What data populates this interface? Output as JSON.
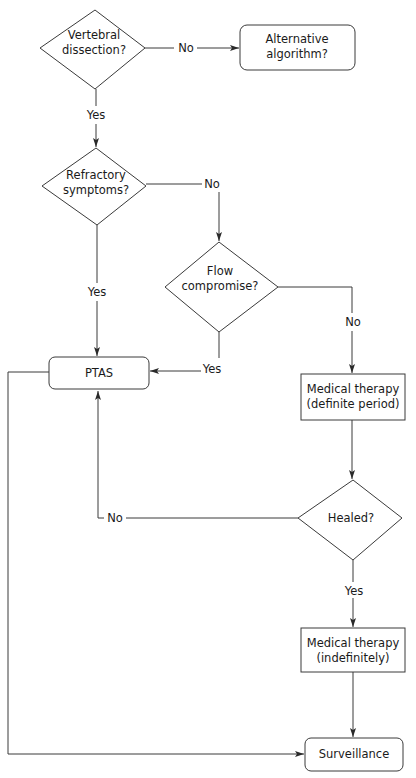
{
  "diagram": {
    "type": "flowchart",
    "nodes": {
      "vertebral_dissection": {
        "shape": "diamond",
        "line1": "Vertebral",
        "line2": "dissection?"
      },
      "alternative_algorithm": {
        "shape": "rounded-rect",
        "line1": "Alternative",
        "line2": "algorithm?"
      },
      "refractory_symptoms": {
        "shape": "diamond",
        "line1": "Refractory",
        "line2": "symptoms?"
      },
      "flow_compromise": {
        "shape": "diamond",
        "line1": "Flow",
        "line2": "compromise?"
      },
      "ptas": {
        "shape": "rounded-rect",
        "label": "PTAS"
      },
      "medical_therapy_definite": {
        "shape": "rect",
        "line1": "Medical therapy",
        "line2": "(definite period)"
      },
      "healed": {
        "shape": "diamond",
        "label": "Healed?"
      },
      "medical_therapy_indefinite": {
        "shape": "rect",
        "line1": "Medical therapy",
        "line2": "(indefinitely)"
      },
      "surveillance": {
        "shape": "rounded-rect",
        "label": "Surveillance"
      }
    },
    "edges": {
      "vd_no": {
        "from": "vertebral_dissection",
        "to": "alternative_algorithm",
        "label": "No"
      },
      "vd_yes": {
        "from": "vertebral_dissection",
        "to": "refractory_symptoms",
        "label": "Yes"
      },
      "rs_no": {
        "from": "refractory_symptoms",
        "to": "flow_compromise",
        "label": "No"
      },
      "rs_yes": {
        "from": "refractory_symptoms",
        "to": "ptas",
        "label": "Yes"
      },
      "fc_yes": {
        "from": "flow_compromise",
        "to": "ptas",
        "label": "Yes"
      },
      "fc_no": {
        "from": "flow_compromise",
        "to": "medical_therapy_definite",
        "label": "No"
      },
      "mtd_to_healed": {
        "from": "medical_therapy_definite",
        "to": "healed",
        "label": ""
      },
      "healed_no": {
        "from": "healed",
        "to": "ptas",
        "label": "No"
      },
      "healed_yes": {
        "from": "healed",
        "to": "medical_therapy_indefinite",
        "label": "Yes"
      },
      "mti_to_surv": {
        "from": "medical_therapy_indefinite",
        "to": "surveillance",
        "label": ""
      },
      "ptas_to_surv": {
        "from": "ptas",
        "to": "surveillance",
        "label": ""
      }
    }
  }
}
